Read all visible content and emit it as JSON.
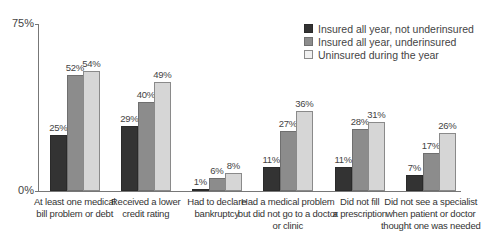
{
  "chart_data": {
    "type": "bar",
    "title": "",
    "xlabel": "",
    "ylabel": "",
    "ylim": [
      0,
      75
    ],
    "y_ticks": [
      "0%",
      "75%"
    ],
    "grid": false,
    "legend_position": "top-right",
    "categories": [
      "At least one medical\nbill problem or debt",
      "Received a lower\ncredit rating",
      "Had to declare\nbankruptcy",
      "Had a medical problem\nbut did not go to a doctor\nor clinic",
      "Did not fill\na prescription",
      "Did not see a specialist\nwhen patient or doctor\nthought one was needed"
    ],
    "series": [
      {
        "name": "Insured all year, not underinsured",
        "color": "#333333",
        "values": [
          25,
          29,
          1,
          11,
          11,
          7
        ]
      },
      {
        "name": "Insured all year, underinsured",
        "color": "#8c8c8c",
        "values": [
          52,
          40,
          6,
          27,
          28,
          17
        ]
      },
      {
        "name": "Uninsured during the year",
        "color": "#d6d6d6",
        "values": [
          54,
          49,
          8,
          36,
          31,
          26
        ]
      }
    ],
    "value_labels": [
      [
        "25%",
        "52%",
        "54%"
      ],
      [
        "29%",
        "40%",
        "49%"
      ],
      [
        "1%",
        "6%",
        "8%"
      ],
      [
        "11%",
        "27%",
        "36%"
      ],
      [
        "11%",
        "28%",
        "31%"
      ],
      [
        "7%",
        "17%",
        "26%"
      ]
    ]
  }
}
